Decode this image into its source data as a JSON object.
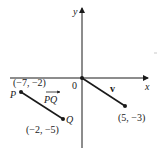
{
  "diagram": {
    "axes": {
      "x_label": "x",
      "y_label": "y",
      "origin_label": "0"
    },
    "points": {
      "P": {
        "label": "P",
        "coords": "(−7, −2)"
      },
      "Q": {
        "label": "Q",
        "coords": "(−2, −5)"
      },
      "V_end": {
        "coords": "(5, −3)"
      }
    },
    "vectors": {
      "PQ": {
        "label": "PQ"
      },
      "v": {
        "label": "v"
      }
    },
    "colors": {
      "ink": "#1a1a1a",
      "background": "#ffffff"
    }
  }
}
